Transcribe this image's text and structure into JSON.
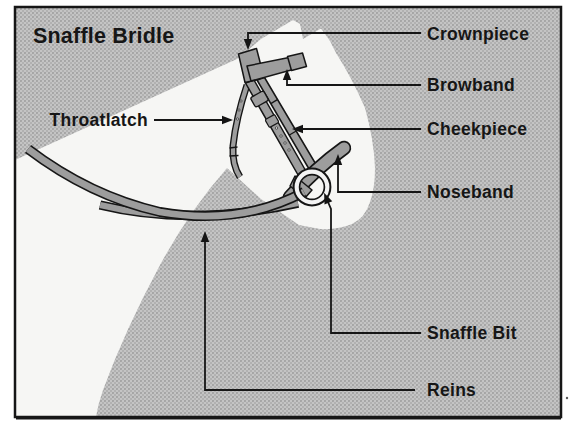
{
  "title": "Snaffle Bridle",
  "parts": {
    "crownpiece": "Crownpiece",
    "browband": "Browband",
    "throatlatch": "Throatlatch",
    "cheekpiece": "Cheekpiece",
    "noseband": "Noseband",
    "snaffle_bit": "Snaffle Bit",
    "reins": "Reins"
  },
  "colors": {
    "background_halftone": "#b7b7b7",
    "horse_silhouette": "#f6f6f4",
    "strap": "#9d9d9d",
    "line": "#161616",
    "frame_border": "#161616",
    "page": "#ffffff"
  }
}
